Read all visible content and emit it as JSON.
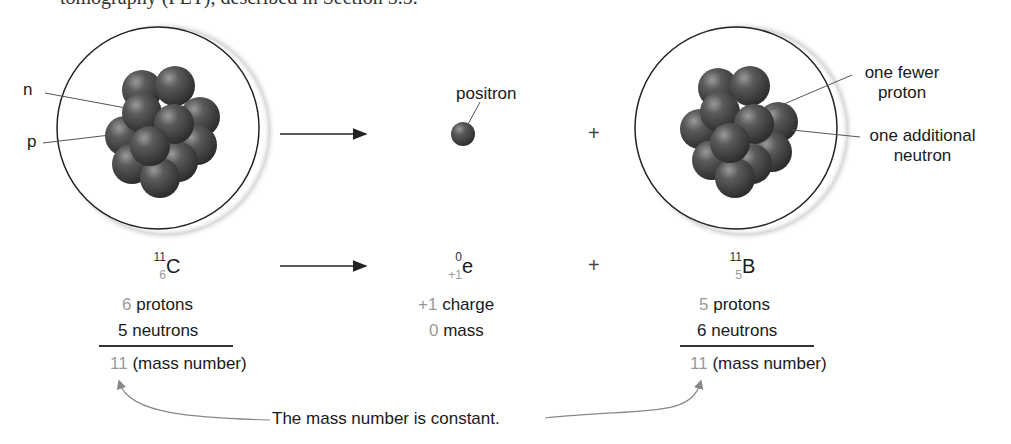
{
  "cutoff_text": "tomography (PET), described in Section 5.5.",
  "left_atom": {
    "labels": {
      "n": "n",
      "p": "p"
    },
    "symbol": "C",
    "mass": "11",
    "atomic": "6",
    "protons_num": "6",
    "protons_label": "protons",
    "neutrons_num": "5",
    "neutrons_label": "neutrons",
    "total_num": "11",
    "total_label": "(mass number)"
  },
  "positron": {
    "label": "positron",
    "symbol": "e",
    "mass": "0",
    "atomic": "+1",
    "charge_num": "+1",
    "charge_label": "charge",
    "mass_num": "0",
    "mass_label": "mass"
  },
  "right_atom": {
    "labels": {
      "fewer_proton": "one fewer proton",
      "fewer_proton_l1": "one fewer",
      "fewer_proton_l2": "proton",
      "add_neutron_l1": "one additional",
      "add_neutron_l2": "neutron"
    },
    "symbol": "B",
    "mass": "11",
    "atomic": "5",
    "protons_num": "5",
    "protons_label": "protons",
    "neutrons_num": "6",
    "neutrons_label": "neutrons",
    "total_num": "11",
    "total_label": "(mass number)"
  },
  "operators": {
    "plus": "+"
  },
  "caption": "The mass number is constant."
}
